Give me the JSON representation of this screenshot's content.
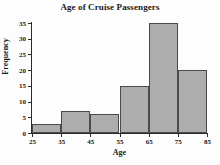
{
  "chart_data": {
    "type": "bar",
    "title": "Age of Cruise Passengers",
    "xlabel": "Age",
    "ylabel": "Frequency",
    "categories": [
      "25-35",
      "35-45",
      "45-55",
      "55-65",
      "65-75",
      "75-85"
    ],
    "values": [
      3,
      7,
      6,
      15,
      35,
      20
    ],
    "bin_edges": [
      25,
      35,
      45,
      55,
      65,
      75,
      85
    ],
    "xlim": [
      25,
      85
    ],
    "ylim": [
      0,
      35
    ],
    "xticks": [
      25,
      35,
      45,
      55,
      65,
      75,
      85
    ],
    "yticks": [
      0,
      5,
      10,
      15,
      20,
      25,
      30,
      35
    ],
    "xtick_labels": [
      "25",
      "35",
      "45",
      "55",
      "65",
      "75",
      "85"
    ],
    "ytick_labels": [
      "0",
      "5",
      "10",
      "15",
      "20",
      "25",
      "30",
      "35"
    ],
    "grid": false,
    "legend": null,
    "bar_color": "#adadad",
    "bar_edge_color": "#4a4a4a",
    "axis_color": "#2b2b2b",
    "background_color": "#fdfdfe",
    "text_color": "#1a1a1a"
  }
}
